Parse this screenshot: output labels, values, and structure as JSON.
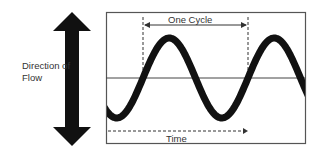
{
  "diagram": {
    "labels": {
      "direction": "Direction of Flow",
      "cycle": "One Cycle",
      "time": "Time"
    },
    "colors": {
      "ink": "#111111",
      "frame": "#444444",
      "background": "#ffffff"
    },
    "wave": {
      "type": "sine",
      "cycles_shown": 2,
      "baseline_y": 78,
      "amplitude_px": 40,
      "period_px": 105,
      "start_phase_crossing_x": 143
    }
  }
}
